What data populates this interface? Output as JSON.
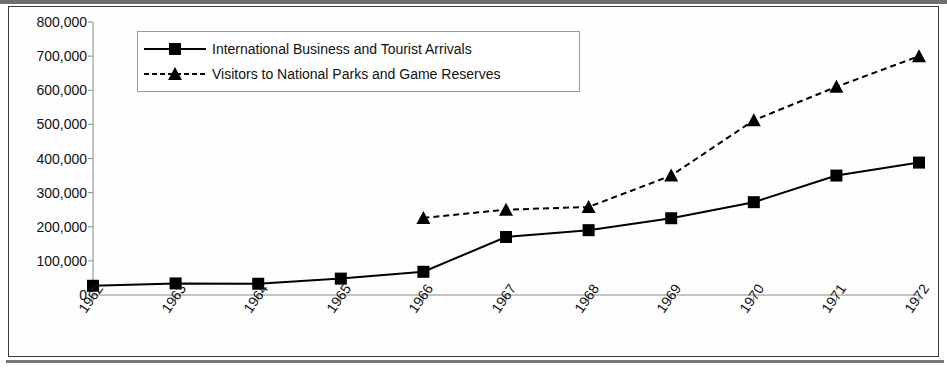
{
  "chart_data": {
    "type": "line",
    "title": "",
    "xlabel": "",
    "ylabel": "",
    "grid": false,
    "legend_position": "top-left-inside",
    "categories": [
      "1962",
      "1963",
      "1964",
      "1965",
      "1966",
      "1967",
      "1968",
      "1969",
      "1970",
      "1971",
      "1972"
    ],
    "ylim": [
      0,
      800000
    ],
    "ytick_labels": [
      "800,000",
      "700,000",
      "600,000",
      "500,000",
      "400,000",
      "300,000",
      "200,000",
      "100,000",
      "0"
    ],
    "ytick_values": [
      800000,
      700000,
      600000,
      500000,
      400000,
      300000,
      200000,
      100000,
      0
    ],
    "series": [
      {
        "name": "International Business and Tourist Arrivals",
        "marker": "square",
        "line_style": "solid",
        "color": "#000000",
        "values": [
          27000,
          34000,
          33000,
          48000,
          68000,
          170000,
          190000,
          225000,
          272000,
          350000,
          388000
        ]
      },
      {
        "name": "Visitors to National Parks and Game Reserves",
        "marker": "triangle",
        "line_style": "dashed",
        "color": "#000000",
        "values": [
          null,
          null,
          null,
          null,
          226000,
          250000,
          258000,
          350000,
          512000,
          610000,
          700000
        ]
      }
    ]
  },
  "legend": {
    "entries": [
      {
        "label": "International Business and Tourist Arrivals"
      },
      {
        "label": "Visitors to National Parks and Game Reserves"
      }
    ]
  },
  "colors": {
    "background": "#ffffff",
    "axis": "#8a8a8a",
    "series": "#000000",
    "frame": "#3a3a3a",
    "text": "#111111"
  }
}
